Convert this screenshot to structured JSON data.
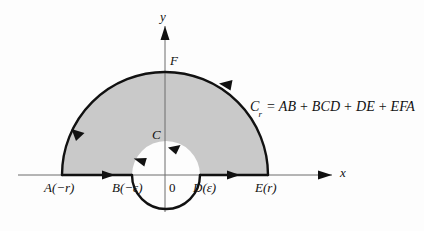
{
  "figure": {
    "type": "complex-contour-integration-diagram",
    "background_color": "#fdfdfd",
    "shaded_region_color": "#c9c9c9",
    "curve_color": "#111111",
    "axis_color": "#555555"
  },
  "axes": {
    "x_label": "x",
    "y_label": "y",
    "origin_label": "0"
  },
  "points": [
    {
      "name": "A",
      "label": "A(−r)"
    },
    {
      "name": "B",
      "label": "B(−ε)"
    },
    {
      "name": "D",
      "label": "D(ε)"
    },
    {
      "name": "E",
      "label": "E(r)"
    },
    {
      "name": "C",
      "label": "C"
    },
    {
      "name": "F",
      "label": "F"
    }
  ],
  "formula": {
    "lhs_symbol": "C",
    "lhs_subscript": "r",
    "equals": "=",
    "terms": [
      "AB",
      "BCD",
      "DE",
      "EFA"
    ],
    "plus": "+",
    "full_text": "Cᵣ = AB + BCD + DE + EFA"
  },
  "arrows": {
    "segment_ab": "right",
    "segment_de": "right",
    "inner_arc_bc": "counterclockwise-up-left",
    "inner_arc_cd": "up-right-at-apex",
    "outer_arc_left": "down-toward-a",
    "outer_arc_right": "up-left-toward-f"
  }
}
